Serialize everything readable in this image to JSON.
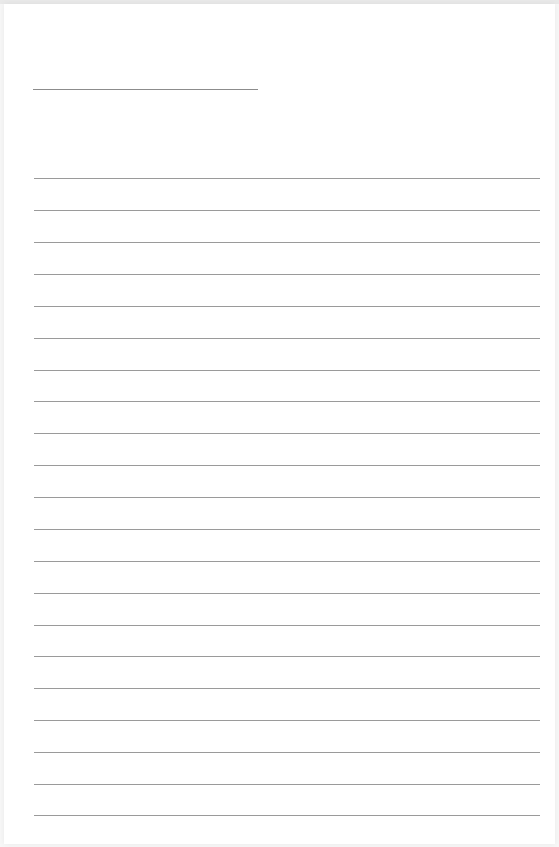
{
  "document": {
    "type": "lined-paper",
    "name_line": {
      "x": 33,
      "y": 89,
      "width": 225
    },
    "ruled_lines": {
      "count": 21,
      "x": 34,
      "width": 506,
      "positions": [
        178,
        210,
        242,
        274,
        306,
        338,
        370,
        401,
        433,
        465,
        497,
        529,
        561,
        593,
        625,
        656,
        688,
        720,
        752,
        784,
        815
      ]
    },
    "colors": {
      "paper": "#ffffff",
      "line": "#9a9a9a",
      "background": "#f7f7f7"
    }
  }
}
